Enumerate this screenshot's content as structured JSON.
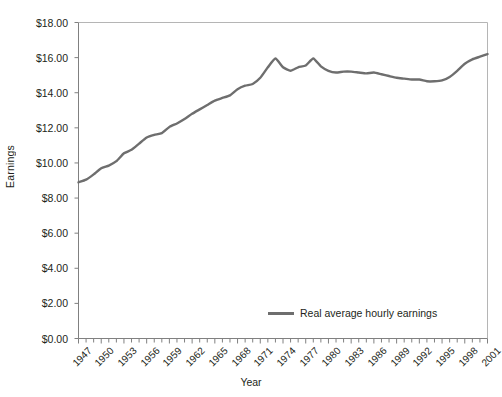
{
  "figure": {
    "cut_off_header_text": "",
    "background_color": "#ffffff"
  },
  "axes": {
    "y_title": "Earnings",
    "x_title": "Year"
  },
  "legend": {
    "entries": [
      {
        "label": "Real average hourly earnings",
        "color": "#6e6e6e"
      }
    ]
  },
  "chart_data": {
    "type": "line",
    "title": "",
    "subtitle": "",
    "xlabel": "Year",
    "ylabel": "Earnings",
    "xlim": [
      1947,
      2001
    ],
    "ylim": [
      0,
      18
    ],
    "grid": false,
    "legend_position": "inside-bottom-right",
    "y_tick_labels": [
      "$0.00",
      "$2.00",
      "$4.00",
      "$6.00",
      "$8.00",
      "$10.00",
      "$12.00",
      "$14.00",
      "$16.00",
      "$18.00"
    ],
    "y_tick_values": [
      0,
      2,
      4,
      6,
      8,
      10,
      12,
      14,
      16,
      18
    ],
    "x_tick_labels": [
      "1947",
      "1950",
      "1953",
      "1956",
      "1959",
      "1962",
      "1965",
      "1968",
      "1971",
      "1974",
      "1977",
      "1980",
      "1983",
      "1986",
      "1989",
      "1992",
      "1995",
      "1998",
      "2001"
    ],
    "x_tick_values": [
      1947,
      1950,
      1953,
      1956,
      1959,
      1962,
      1965,
      1968,
      1971,
      1974,
      1977,
      1980,
      1983,
      1986,
      1989,
      1992,
      1995,
      1998,
      2001
    ],
    "x_minor_tick_step": 1,
    "series": [
      {
        "name": "Real average hourly earnings",
        "color": "#6e6e6e",
        "line_width": 2.4,
        "x": [
          1947,
          1948,
          1949,
          1950,
          1951,
          1952,
          1953,
          1954,
          1955,
          1956,
          1957,
          1958,
          1959,
          1960,
          1961,
          1962,
          1963,
          1964,
          1965,
          1966,
          1967,
          1968,
          1969,
          1970,
          1971,
          1972,
          1973,
          1974,
          1975,
          1976,
          1977,
          1978,
          1979,
          1980,
          1981,
          1982,
          1983,
          1984,
          1985,
          1986,
          1987,
          1988,
          1989,
          1990,
          1991,
          1992,
          1993,
          1994,
          1995,
          1996,
          1997,
          1998,
          1999,
          2000,
          2001
        ],
        "y": [
          8.9,
          9.05,
          9.35,
          9.7,
          9.85,
          10.1,
          10.55,
          10.75,
          11.1,
          11.45,
          11.6,
          11.7,
          12.05,
          12.25,
          12.5,
          12.8,
          13.05,
          13.3,
          13.55,
          13.7,
          13.85,
          14.2,
          14.4,
          14.5,
          14.85,
          15.45,
          15.95,
          15.45,
          15.25,
          15.45,
          15.55,
          15.95,
          15.5,
          15.25,
          15.15,
          15.2,
          15.2,
          15.15,
          15.1,
          15.15,
          15.05,
          14.95,
          14.85,
          14.8,
          14.75,
          14.75,
          14.65,
          14.65,
          14.7,
          14.9,
          15.25,
          15.65,
          15.9,
          16.05,
          16.2
        ]
      }
    ]
  }
}
